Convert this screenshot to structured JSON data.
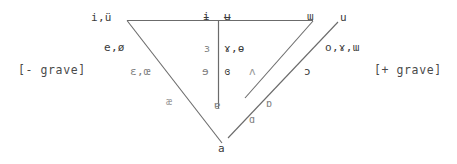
{
  "diagram": {
    "line_color": "#6b6b6b",
    "text_color": "#3a3a3a",
    "background": "#ffffff"
  },
  "side_labels": {
    "left": "[- grave]",
    "right": "[+ grave]"
  },
  "vowels": {
    "front": [
      {
        "id": "front-high",
        "text": "i,ü"
      },
      {
        "id": "front-mid-high",
        "text": "e,ø"
      },
      {
        "id": "front-mid-low",
        "text": "ε,œ"
      },
      {
        "id": "front-low",
        "text": "æ"
      }
    ],
    "central_left": [
      {
        "id": "central-high-left",
        "text": "ɨ"
      },
      {
        "id": "central-mid-left",
        "text": "ɜ"
      },
      {
        "id": "central-low-mid-left",
        "text": "ɘ"
      }
    ],
    "central_right": [
      {
        "id": "central-high-right",
        "text": "ʉ"
      },
      {
        "id": "central-mid-right",
        "text": "ɤ,ɵ"
      },
      {
        "id": "central-low-mid-right",
        "text": "ɞ"
      }
    ],
    "central_bottom": [
      {
        "id": "central-open",
        "text": "ɐ"
      }
    ],
    "back_inner": [
      {
        "id": "back-high-inner",
        "text": "ɯ"
      },
      {
        "id": "back-mid-inner",
        "text": "ʌ"
      },
      {
        "id": "back-low-inner",
        "text": "ɒ"
      },
      {
        "id": "back-lowest-inner",
        "text": "ɑ"
      }
    ],
    "back_outer": [
      {
        "id": "back-high-outer",
        "text": "u"
      },
      {
        "id": "back-mid-high-outer",
        "text": "o,ɤ,ɯ"
      },
      {
        "id": "back-mid-low-outer",
        "text": "ɔ"
      }
    ],
    "apex": [
      {
        "id": "apex-low",
        "text": "a"
      }
    ]
  }
}
